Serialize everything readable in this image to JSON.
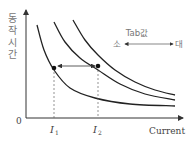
{
  "chart_data": {
    "type": "line",
    "title": "",
    "xlabel": "Current",
    "ylabel": "동작시간",
    "origin_label": "0",
    "x_ticks": [
      {
        "main": "I",
        "sub": "1"
      },
      {
        "main": "I",
        "sub": "2"
      }
    ],
    "annotation": {
      "label": "Tab값",
      "left": "소",
      "right": "대"
    },
    "series": [
      {
        "name": "curve-small-tab",
        "points": [
          [
            37,
            25
          ],
          [
            44,
            50
          ],
          [
            54,
            70
          ],
          [
            70,
            88
          ],
          [
            95,
            98
          ],
          [
            130,
            104
          ],
          [
            175,
            106
          ]
        ]
      },
      {
        "name": "curve-mid-tab",
        "points": [
          [
            54,
            22
          ],
          [
            65,
            42
          ],
          [
            80,
            58
          ],
          [
            98,
            70
          ],
          [
            120,
            84
          ],
          [
            145,
            94
          ],
          [
            175,
            100
          ]
        ]
      },
      {
        "name": "curve-large-tab",
        "points": [
          [
            73,
            20
          ],
          [
            85,
            40
          ],
          [
            98,
            55
          ],
          [
            115,
            70
          ],
          [
            135,
            82
          ],
          [
            155,
            90
          ],
          [
            175,
            95
          ]
        ]
      }
    ],
    "markers": [
      {
        "x": 54,
        "y": 68,
        "label": "I1"
      },
      {
        "x": 98,
        "y": 66,
        "label": "I2"
      }
    ],
    "grid": false,
    "colors": {
      "curve": "#222222",
      "axis": "#333333",
      "text": "#444444"
    }
  }
}
